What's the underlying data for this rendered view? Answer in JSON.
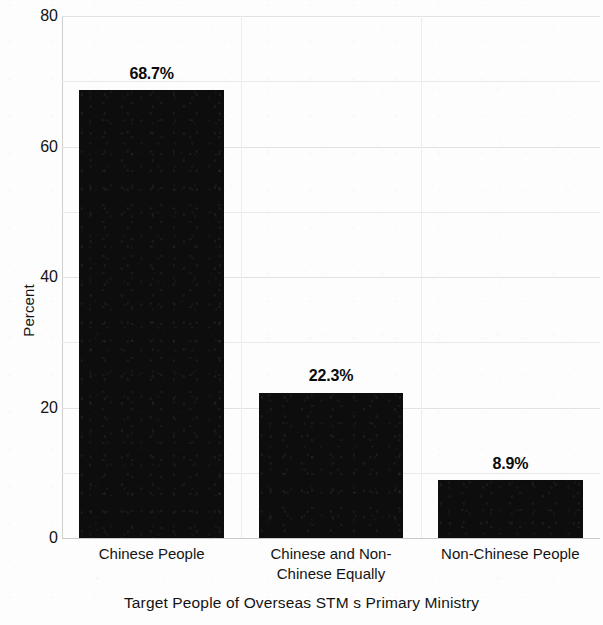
{
  "chart_data": {
    "type": "bar",
    "title": "",
    "subtitle": "",
    "xlabel": "Target People of Overseas STM s Primary Ministry",
    "ylabel": "Percent",
    "categories": [
      "Chinese People",
      "Chinese and Non-Chinese Equally",
      "Non-Chinese People"
    ],
    "category_lines": [
      [
        "Chinese People"
      ],
      [
        "Chinese and Non-",
        "Chinese Equally"
      ],
      [
        "Non-Chinese People"
      ]
    ],
    "values": [
      68.7,
      22.3,
      8.9
    ],
    "data_labels": [
      "68.7%",
      "22.3%",
      "8.9%"
    ],
    "ylim": [
      0,
      80
    ],
    "yticks": [
      0,
      20,
      40,
      60,
      80
    ],
    "ytick_labels": [
      "0",
      "20",
      "40",
      "60",
      "80"
    ],
    "minor_gridlines_y": [
      10,
      30,
      50,
      70
    ],
    "grid": true,
    "legend": null,
    "legend_position": "none",
    "bar_color": "#0d0d0d",
    "background_color": "#fdfdfd",
    "gridline_color": "#e9e9e9",
    "axis_color": "#c9c9c9",
    "text_color": "#141414"
  }
}
